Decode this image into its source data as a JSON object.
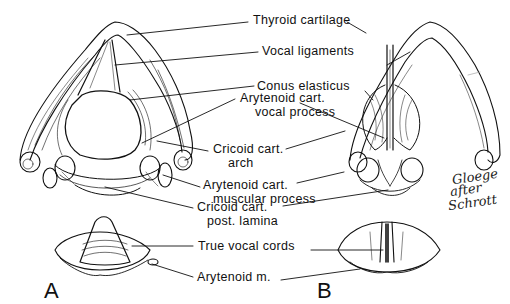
{
  "figure": {
    "panels": [
      {
        "id": "A",
        "label": "A"
      },
      {
        "id": "B",
        "label": "B"
      }
    ],
    "labels": {
      "thyroid_cartilage": "Thyroid cartilage",
      "vocal_ligaments": "Vocal ligaments",
      "conus_elasticus": "Conus elasticus",
      "arytenoid_vocal_line1": "Arytenoid cart.",
      "arytenoid_vocal_line2": "vocal process",
      "cricoid_arch_line1": "Cricoid cart.",
      "cricoid_arch_line2": "arch",
      "arytenoid_muscular_line1": "Arytenoid cart.",
      "arytenoid_muscular_line2": "muscular process",
      "cricoid_lamina_line1": "Cricoid cart.",
      "cricoid_lamina_line2": "post. lamina",
      "true_vocal_cords": "True vocal cords",
      "arytenoid_muscle": "Arytenoid m."
    },
    "signature": {
      "line1": "Gloege",
      "line2": "after",
      "line3": "Schrott"
    },
    "colors": {
      "ink": "#111111",
      "background": "#ffffff"
    }
  }
}
